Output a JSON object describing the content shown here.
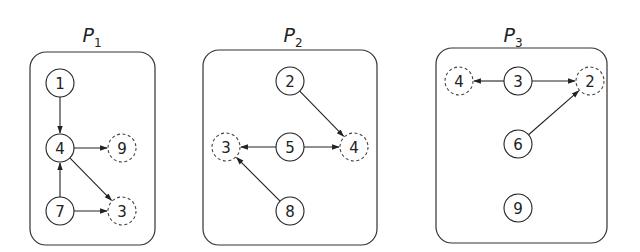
{
  "panels": [
    {
      "title": "P",
      "subscript": "1",
      "box": {
        "x": 30,
        "y": 52,
        "w": 125,
        "h": 193
      },
      "title_pos": {
        "x": 92,
        "y": 42
      },
      "nodes": [
        {
          "id": "1",
          "x": 60,
          "y": 83,
          "dashed": false
        },
        {
          "id": "4",
          "x": 60,
          "y": 148,
          "dashed": false
        },
        {
          "id": "9",
          "x": 122,
          "y": 148,
          "dashed": true
        },
        {
          "id": "7",
          "x": 60,
          "y": 211,
          "dashed": false
        },
        {
          "id": "3",
          "x": 122,
          "y": 211,
          "dashed": true
        }
      ],
      "edges": [
        [
          "1",
          "4"
        ],
        [
          "4",
          "9"
        ],
        [
          "4",
          "3"
        ],
        [
          "7",
          "4"
        ],
        [
          "7",
          "3"
        ]
      ]
    },
    {
      "title": "P",
      "subscript": "2",
      "box": {
        "x": 203,
        "y": 50,
        "w": 174,
        "h": 195
      },
      "title_pos": {
        "x": 293,
        "y": 42
      },
      "nodes": [
        {
          "id": "2",
          "x": 290,
          "y": 81,
          "dashed": false
        },
        {
          "id": "3",
          "x": 226,
          "y": 147,
          "dashed": true
        },
        {
          "id": "5",
          "x": 290,
          "y": 147,
          "dashed": false
        },
        {
          "id": "4",
          "x": 354,
          "y": 147,
          "dashed": true
        },
        {
          "id": "8",
          "x": 290,
          "y": 211,
          "dashed": false
        }
      ],
      "edges": [
        [
          "2",
          "4"
        ],
        [
          "5",
          "3"
        ],
        [
          "5",
          "4"
        ],
        [
          "8",
          "3"
        ]
      ]
    },
    {
      "title": "P",
      "subscript": "3",
      "box": {
        "x": 436,
        "y": 48,
        "w": 171,
        "h": 195
      },
      "title_pos": {
        "x": 513,
        "y": 42
      },
      "nodes": [
        {
          "id": "4",
          "x": 459,
          "y": 81,
          "dashed": true
        },
        {
          "id": "3",
          "x": 518,
          "y": 81,
          "dashed": false
        },
        {
          "id": "2",
          "x": 590,
          "y": 81,
          "dashed": true
        },
        {
          "id": "6",
          "x": 518,
          "y": 144,
          "dashed": false
        },
        {
          "id": "9",
          "x": 518,
          "y": 208,
          "dashed": false
        }
      ],
      "edges": [
        [
          "3",
          "4"
        ],
        [
          "3",
          "2"
        ],
        [
          "6",
          "2"
        ]
      ]
    }
  ],
  "node_radius": 14
}
